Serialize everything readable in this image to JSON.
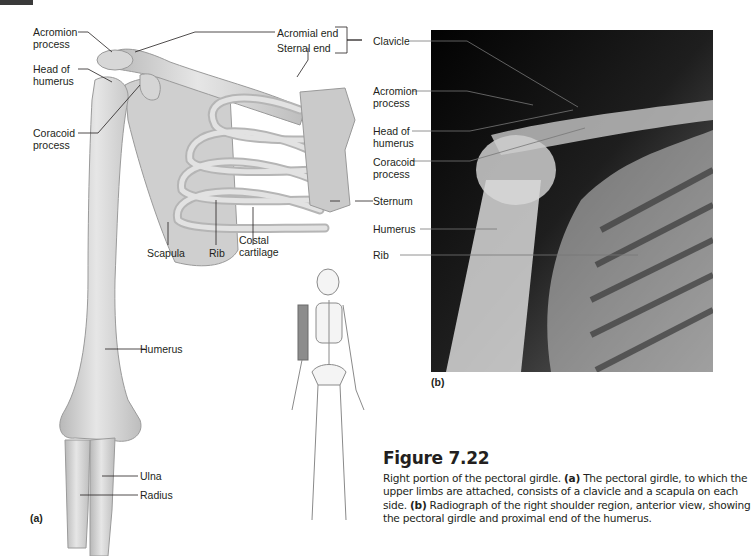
{
  "figure": {
    "number": "Figure 7.22",
    "caption": {
      "intro": "Right portion of the pectoral girdle. ",
      "a_tag": "(a)",
      "a_text": " The pectoral girdle, to which the upper limbs are attached, consists of a clavicle and a scapula on each side. ",
      "b_tag": "(b)",
      "b_text": " Radiograph of the right shoulder region, anterior view, showing the pectoral girdle and proximal end of the humerus."
    }
  },
  "panel_a": {
    "tag": "(a)",
    "labels": {
      "acromion_process": "Acromion\nprocess",
      "head_of_humerus": "Head of\nhumerus",
      "coracoid_process": "Coracoid\nprocess",
      "acromial_end": "Acromial end",
      "sternal_end": "Sternal end",
      "clavicle": "Clavicle",
      "scapula": "Scapula",
      "rib": "Rib",
      "costal_cartilage": "Costal\ncartilage",
      "sternum": "Sternum",
      "humerus": "Humerus",
      "ulna": "Ulna",
      "radius": "Radius"
    }
  },
  "panel_b": {
    "tag": "(b)",
    "labels": {
      "acromion_process": "Acromion\nprocess",
      "head_of_humerus": "Head of\nhumerus",
      "coracoid_process": "Coracoid\nprocess",
      "humerus": "Humerus",
      "rib": "Rib"
    }
  },
  "colors": {
    "text": "#231f20",
    "bone": "#d9d9d9",
    "bone_shade": "#a8a8a8",
    "leader": "#231f20",
    "xray_bg": "#0a0a0a",
    "highlight": "#7a7a7a"
  }
}
